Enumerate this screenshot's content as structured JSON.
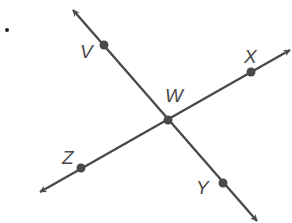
{
  "diagram": {
    "colors": {
      "line": "#4a4a4a",
      "point": "#4a4a4a",
      "label": "#4a4a4a",
      "background": "#ffffff"
    },
    "list_marker": ".",
    "points": [
      {
        "id": "V",
        "label": "V",
        "x": 104,
        "y": 45,
        "label_x": 80,
        "label_y": 58
      },
      {
        "id": "W",
        "label": "W",
        "x": 168,
        "y": 120,
        "label_x": 165,
        "label_y": 102
      },
      {
        "id": "X",
        "label": "X",
        "x": 251,
        "y": 72,
        "label_x": 244,
        "label_y": 63
      },
      {
        "id": "Y",
        "label": "Y",
        "x": 223,
        "y": 183,
        "label_x": 196,
        "label_y": 194
      },
      {
        "id": "Z",
        "label": "Z",
        "x": 81,
        "y": 168,
        "label_x": 62,
        "label_y": 164
      }
    ],
    "lines": [
      {
        "id": "line-VY",
        "through": [
          "V",
          "W",
          "Y"
        ],
        "x1": 73,
        "y1": 10,
        "x2": 257,
        "y2": 221,
        "arrows": "both"
      },
      {
        "id": "line-ZX",
        "through": [
          "Z",
          "W",
          "X"
        ],
        "x1": 40,
        "y1": 192,
        "x2": 290,
        "y2": 50,
        "arrows": "both"
      }
    ]
  }
}
